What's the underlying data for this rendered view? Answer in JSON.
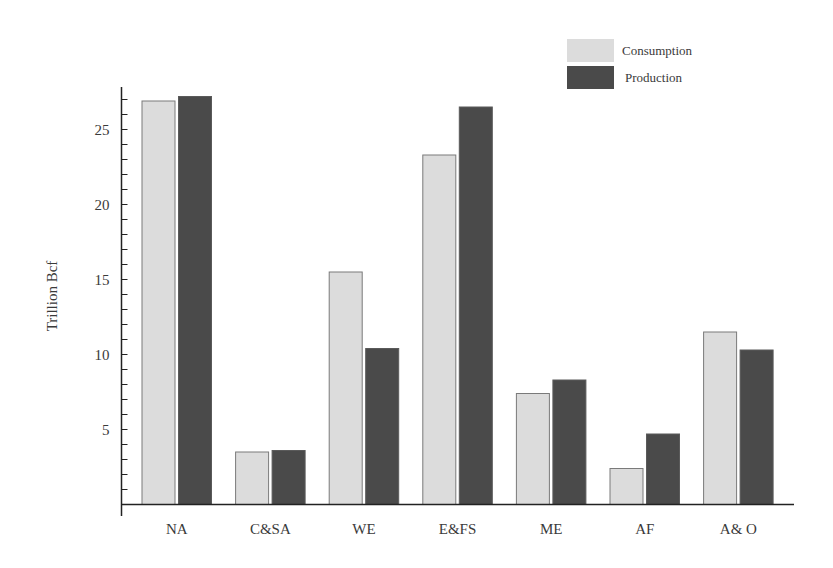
{
  "chart_data": {
    "type": "bar",
    "title": "",
    "xlabel": "",
    "ylabel": "Trillion Bcf",
    "categories": [
      "NA",
      "C&SA",
      "WE",
      "E&FS",
      "ME",
      "AF",
      "A& O"
    ],
    "series": [
      {
        "name": "Consumption",
        "color": "#dcdcdc",
        "values": [
          26.9,
          3.5,
          15.5,
          23.3,
          7.4,
          2.4,
          11.5
        ]
      },
      {
        "name": "Production",
        "color": "#4a4a4a",
        "values": [
          27.2,
          3.6,
          10.4,
          26.5,
          8.3,
          4.7,
          10.3
        ]
      }
    ],
    "ylim": [
      0,
      28
    ],
    "yticks": [
      5,
      10,
      15,
      20,
      25
    ],
    "minor_tick_step": 1,
    "grid": false,
    "legend_position": "top-right"
  },
  "colors": {
    "consumption_fill": "#dcdcdc",
    "consumption_stroke": "#7a7a7a",
    "production_fill": "#4a4a4a",
    "production_stroke": "#5a5a5a",
    "axis": "#222222"
  }
}
